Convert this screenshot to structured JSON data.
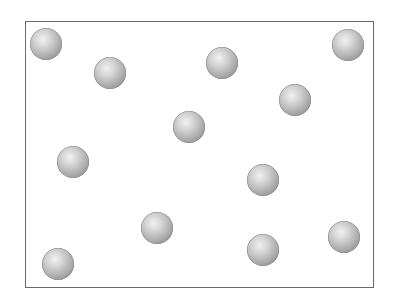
{
  "diagram": {
    "container": {
      "left": 25,
      "top": 21,
      "right": 374,
      "bottom": 288,
      "border_color": "#6a6a6a"
    },
    "particle_style": {
      "radius": 16,
      "highlight_color": "#f2f2f2",
      "mid_color": "#a8a8a8",
      "shadow_color": "#7c7c7c"
    },
    "particles": [
      {
        "id": 1,
        "x": 46,
        "y": 44
      },
      {
        "id": 2,
        "x": 110,
        "y": 73
      },
      {
        "id": 3,
        "x": 222,
        "y": 63
      },
      {
        "id": 4,
        "x": 348,
        "y": 45
      },
      {
        "id": 5,
        "x": 295,
        "y": 100
      },
      {
        "id": 6,
        "x": 189,
        "y": 127
      },
      {
        "id": 7,
        "x": 73,
        "y": 162
      },
      {
        "id": 8,
        "x": 263,
        "y": 180
      },
      {
        "id": 9,
        "x": 157,
        "y": 228
      },
      {
        "id": 10,
        "x": 344,
        "y": 237
      },
      {
        "id": 11,
        "x": 263,
        "y": 250
      },
      {
        "id": 12,
        "x": 58,
        "y": 264
      }
    ],
    "particle_count": 12
  }
}
